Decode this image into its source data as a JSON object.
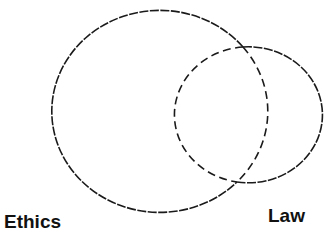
{
  "diagram": {
    "type": "venn",
    "sets": [
      {
        "name": "Ethics",
        "shape": "ellipse",
        "cx": 159,
        "cy": 111,
        "rx": 108,
        "ry": 101,
        "outer_stroke": "fine-dash",
        "inner_stroke": "wide-dash"
      },
      {
        "name": "Law",
        "shape": "ellipse",
        "cx": 246,
        "cy": 114,
        "rx": 74,
        "ry": 68,
        "outer_stroke": "fine-dash",
        "inner_stroke": "wide-dash"
      }
    ],
    "intersections": [
      {
        "x": 243,
        "y": 47
      },
      {
        "x": 237,
        "y": 182
      }
    ],
    "stroke_color": "#1a1a1a",
    "background": "#ffffff"
  },
  "labels": {
    "ethics": "Ethics",
    "law": "Law"
  }
}
